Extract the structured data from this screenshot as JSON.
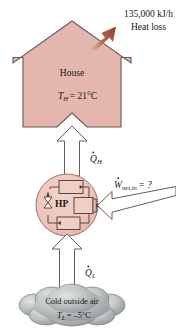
{
  "figure": {
    "type": "thermodynamics-schematic",
    "background_color": "#ffffff"
  },
  "heat_loss": {
    "rate_label": "135,000 kJ/h",
    "caption": "Heat loss",
    "arrow_color": "#9e4b38",
    "direction": "up-right"
  },
  "house": {
    "label": "House",
    "temperature_symbol": "T",
    "temperature_subscript": "H",
    "temperature_value": "= 21°C",
    "temperature_full": "T_H = 21°C",
    "fill_color": "#e3b7ad",
    "outline_color": "#6b5b55"
  },
  "q_high": {
    "symbol": "Q",
    "subscript": "H",
    "full": "Q̇_H",
    "direction": "up",
    "description": "heat delivered to house"
  },
  "heat_pump": {
    "label": "HP",
    "fill_color": "#eec4ba",
    "outline_color": "#8a6a60",
    "components": [
      {
        "name": "condenser",
        "position": "top"
      },
      {
        "name": "expansion-valve",
        "position": "left"
      },
      {
        "name": "compressor",
        "position": "right"
      },
      {
        "name": "evaporator",
        "position": "bottom"
      }
    ]
  },
  "work_input": {
    "symbol": "W",
    "subscript": "net,in",
    "value": "= ?",
    "full": "Ẇ_net,in = ?",
    "direction": "left-into-compressor"
  },
  "q_low": {
    "symbol": "Q",
    "subscript": "L",
    "full": "Q̇_L",
    "direction": "up",
    "description": "heat absorbed from outside air"
  },
  "outside_air": {
    "label": "Cold outside air",
    "temperature_symbol": "T",
    "temperature_subscript": "L",
    "temperature_value": "= –5°C",
    "temperature_full": "T_L = –5°C",
    "fill_color": "#b9bcbd",
    "outline_color": "#6e7476"
  },
  "arrows": {
    "outline_color": "#6b5b55",
    "fill_color": "#ffffff"
  }
}
